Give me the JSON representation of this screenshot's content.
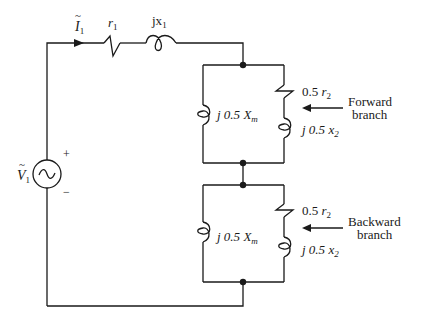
{
  "diagram": {
    "source": {
      "label_main": "V",
      "label_sub": "1",
      "plus": "+",
      "minus": "−",
      "symbol": "~"
    },
    "current": {
      "label_main": "I",
      "label_sub": "1"
    },
    "series": {
      "resistor": {
        "label_main": "r",
        "label_sub": "1"
      },
      "reactor": {
        "label_main": "jx",
        "label_sub": "1"
      }
    },
    "forward_branch": {
      "magnetizing": {
        "prefix": "j 0.5 ",
        "main": "X",
        "sub": "m"
      },
      "resistor": {
        "prefix": "0.5 ",
        "main": "r",
        "sub": "2"
      },
      "reactor": {
        "prefix": "j 0.5 ",
        "main": "x",
        "sub": "2"
      },
      "annotation_line1": "Forward",
      "annotation_line2": "branch"
    },
    "backward_branch": {
      "magnetizing": {
        "prefix": "j 0.5 ",
        "main": "X",
        "sub": "m"
      },
      "resistor": {
        "prefix": "0.5 ",
        "main": "r",
        "sub": "2"
      },
      "reactor": {
        "prefix": "j 0.5 ",
        "main": "x",
        "sub": "2"
      },
      "annotation_line1": "Backward",
      "annotation_line2": "branch"
    }
  }
}
